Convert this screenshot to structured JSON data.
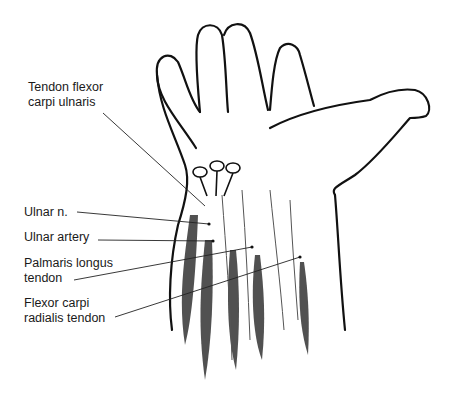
{
  "figure": {
    "labels": [
      {
        "id": "tendon-fcu",
        "text": "Tendon flexor\ncarpi ulnaris",
        "x": 28,
        "y": 80
      },
      {
        "id": "ulnar-nerve",
        "text": "Ulnar n.",
        "x": 24,
        "y": 205
      },
      {
        "id": "ulnar-artery",
        "text": "Ulnar artery",
        "x": 24,
        "y": 230
      },
      {
        "id": "palmaris-longus",
        "text": "Palmaris longus\ntendon",
        "x": 24,
        "y": 256
      },
      {
        "id": "fcr-tendon",
        "text": "Flexor carpi\nradialis tendon",
        "x": 24,
        "y": 296
      }
    ],
    "leaders": [
      {
        "from": [
          103,
          113
        ],
        "to": [
          205,
          206
        ]
      },
      {
        "from": [
          77,
          212
        ],
        "to": [
          209,
          224
        ]
      },
      {
        "from": [
          98,
          240
        ],
        "to": [
          213,
          241
        ]
      },
      {
        "from": [
          74,
          280
        ],
        "to": [
          252,
          247
        ]
      },
      {
        "from": [
          115,
          317
        ],
        "to": [
          300,
          257
        ]
      }
    ]
  }
}
